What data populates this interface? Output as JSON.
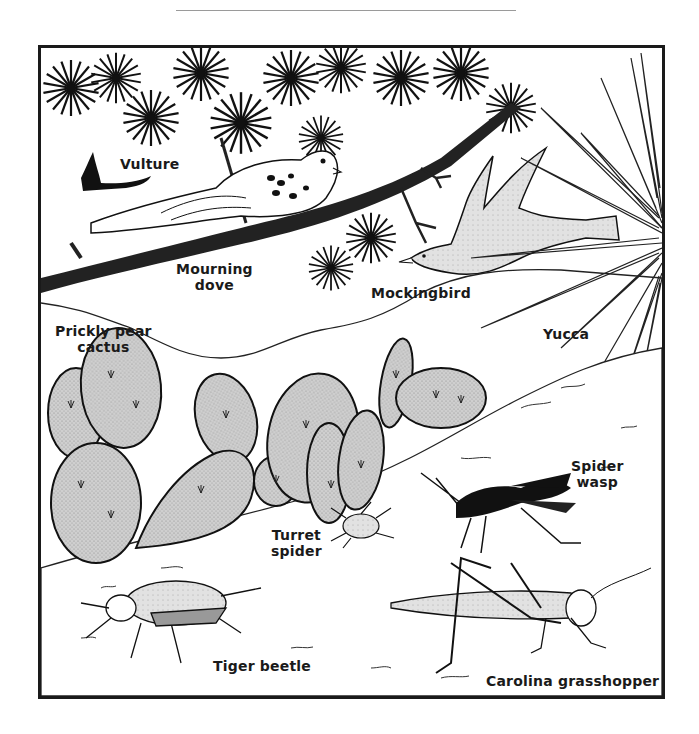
{
  "figure": {
    "type": "habitat-illustration",
    "style": "black ink line drawing with gray stippled fills"
  },
  "labels": {
    "vulture": "Vulture",
    "mourning_dove_line1": "Mourning",
    "mourning_dove_line2": "dove",
    "mockingbird": "Mockingbird",
    "prickly_pear_line1": "Prickly pear",
    "prickly_pear_line2": "cactus",
    "yucca": "Yucca",
    "spider_wasp_line1": "Spider",
    "spider_wasp_line2": "wasp",
    "turret_spider_line1": "Turret",
    "turret_spider_line2": "spider",
    "tiger_beetle": "Tiger beetle",
    "carolina_grasshopper": "Carolina grasshopper"
  },
  "colors": {
    "ink": "#1a1a1a",
    "fill_gray": "#c8c8c8",
    "bird_gray": "#dcdcdc",
    "background": "#ffffff",
    "rule": "#9a9a9a"
  }
}
